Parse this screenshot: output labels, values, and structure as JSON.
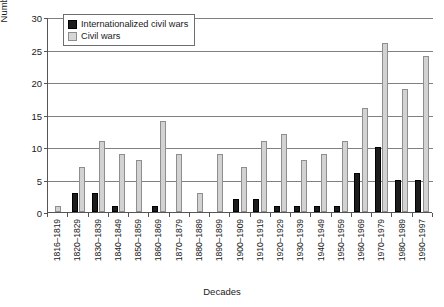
{
  "chart_data": {
    "type": "bar",
    "title": "",
    "xlabel": "Decades",
    "ylabel": "Number of war onsets",
    "ylim": [
      0,
      30
    ],
    "ytick_labels": [
      "0",
      "5",
      "10",
      "15",
      "20",
      "25",
      "30"
    ],
    "yticks": [
      0,
      5,
      10,
      15,
      20,
      25,
      30
    ],
    "grid": "horizontal",
    "legend_position": "top-left inside plot",
    "categories": [
      "1816–1819",
      "1820–1829",
      "1830–1839",
      "1840–1849",
      "1850–1859",
      "1860–1869",
      "1870–1879",
      "1880–1889",
      "1890–1899",
      "1900–1909",
      "1910–1919",
      "1920–1929",
      "1930–1939",
      "1940–1949",
      "1950–1959",
      "1960–1969",
      "1970–1979",
      "1980–1989",
      "1990–1997"
    ],
    "series": [
      {
        "name": "Internationalized civil wars",
        "color": "#1c1c1c",
        "values": [
          0,
          3,
          3,
          1,
          0,
          1,
          0,
          0,
          0,
          2,
          2,
          1,
          1,
          1,
          1,
          6,
          10,
          5,
          5
        ]
      },
      {
        "name": "Civil wars",
        "color": "#d2d2d2",
        "values": [
          1,
          7,
          11,
          9,
          8,
          14,
          9,
          3,
          9,
          7,
          11,
          12,
          8,
          9,
          11,
          16,
          26,
          19,
          24
        ]
      }
    ]
  },
  "legend": {
    "items": [
      {
        "label": "Internationalized civil wars",
        "swatch": "dark"
      },
      {
        "label": "Civil wars",
        "swatch": "light"
      }
    ]
  }
}
